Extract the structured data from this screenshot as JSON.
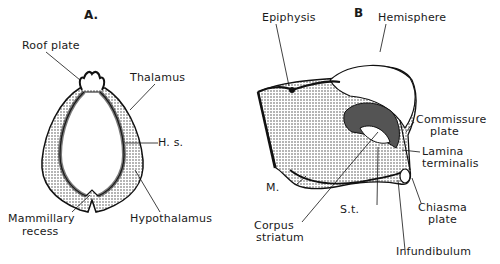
{
  "figure": {
    "panel_a": {
      "title": "A.",
      "labels": {
        "roof_plate": "Roof plate",
        "thalamus": "Thalamus",
        "hs": "H. s.",
        "mammillary_1": "Mammillary",
        "mammillary_2": "recess",
        "hypothalamus": "Hypothalamus"
      }
    },
    "panel_b": {
      "title": "B",
      "labels": {
        "epiphysis": "Epiphysis",
        "hemisphere": "Hemisphere",
        "commissure_1": "Commissure",
        "commissure_2": "plate",
        "lamina_1": "Lamina",
        "lamina_2": "terminalis",
        "m": "M.",
        "st": "S.t.",
        "chiasma_1": "Chiasma",
        "chiasma_2": "plate",
        "corpus_1": "Corpus",
        "corpus_2": "striatum",
        "infundibulum": "Infundibulum"
      }
    },
    "colors": {
      "ink": "#1a1a1a",
      "paper": "#ffffff",
      "shade": "#555555"
    }
  }
}
